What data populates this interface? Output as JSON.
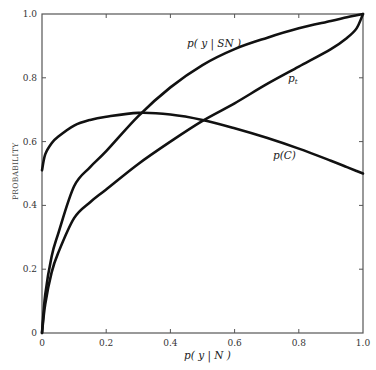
{
  "chart_data": {
    "type": "line",
    "title": "",
    "xlabel": "p( y | N )",
    "ylabel": "PROBABILITY",
    "xlim": [
      0,
      1
    ],
    "ylim": [
      0,
      1
    ],
    "grid": false,
    "legend": "inline labels on curves",
    "x_ticks": [
      "0",
      "0.2",
      "0.4",
      "0.6",
      "0.8",
      "1.0"
    ],
    "y_ticks": [
      "0",
      "0.2",
      "0.4",
      "0.6",
      "0.8",
      "1.0"
    ],
    "x": [
      0,
      0.01,
      0.03,
      0.05,
      0.1,
      0.15,
      0.2,
      0.3,
      0.4,
      0.5,
      0.6,
      0.7,
      0.8,
      0.9,
      0.95,
      0.98,
      1.0
    ],
    "series": [
      {
        "name": "p(y|SN)",
        "label": "p( y | SN )",
        "values": [
          0,
          0.12,
          0.24,
          0.31,
          0.46,
          0.52,
          0.57,
          0.68,
          0.77,
          0.84,
          0.89,
          0.925,
          0.955,
          0.978,
          0.99,
          0.996,
          1.0
        ]
      },
      {
        "name": "p_t",
        "label": "p_t",
        "values": [
          0,
          0.09,
          0.19,
          0.25,
          0.36,
          0.41,
          0.45,
          0.53,
          0.6,
          0.665,
          0.72,
          0.78,
          0.835,
          0.89,
          0.925,
          0.955,
          1.0
        ]
      },
      {
        "name": "p(C)",
        "label": "p(C)",
        "values": [
          0.51,
          0.56,
          0.595,
          0.615,
          0.65,
          0.668,
          0.678,
          0.69,
          0.685,
          0.668,
          0.642,
          0.612,
          0.578,
          0.54,
          0.52,
          0.508,
          0.5
        ]
      }
    ],
    "annotations": [
      {
        "text": "p( y | SN )",
        "x": 0.45,
        "y": 0.91
      },
      {
        "text": "p",
        "sub": "t",
        "x": 0.77,
        "y": 0.79
      },
      {
        "text": "p(C)",
        "x": 0.72,
        "y": 0.55
      }
    ]
  }
}
